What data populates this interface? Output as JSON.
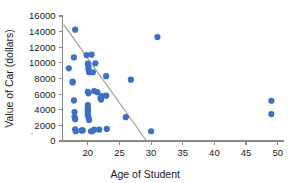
{
  "chart_data": {
    "type": "scatter",
    "title": "",
    "subtitle": "",
    "xlabel": "Age of Student",
    "ylabel": "Value of Car (dollars)",
    "xlim": [
      16,
      51
    ],
    "ylim": [
      0,
      16000
    ],
    "xticks": [
      20,
      25,
      30,
      35,
      40,
      45,
      50
    ],
    "xticklabels": [
      "20",
      "25",
      "30",
      "35",
      "40",
      "45",
      "50"
    ],
    "yticks": [
      0,
      2000,
      4000,
      6000,
      8000,
      10000,
      12000,
      14000,
      16000
    ],
    "yticklabels": [
      "0",
      "2000",
      "4000",
      "6000",
      "8000",
      "10000",
      "12000",
      "14000",
      "16000"
    ],
    "grid": false,
    "legend": null,
    "marker_color": "#3d6fc4",
    "marker_size": 3.1,
    "axis_color": "#8a8a8a",
    "trend_line": {
      "name": "least-squares regression line",
      "color": "#9a9a94",
      "x": [
        16.2,
        29.2
      ],
      "y": [
        14900,
        100
      ]
    },
    "series": [
      {
        "name": "Students",
        "points": [
          [
            18.0,
            14250
          ],
          [
            17.8,
            10700
          ],
          [
            17.0,
            9300
          ],
          [
            17.6,
            7600
          ],
          [
            17.6,
            7500
          ],
          [
            17.8,
            5200
          ],
          [
            17.9,
            3700
          ],
          [
            17.9,
            3100
          ],
          [
            18.0,
            2800
          ],
          [
            18.0,
            1500
          ],
          [
            18.1,
            1250
          ],
          [
            19.0,
            1350
          ],
          [
            19.2,
            1350
          ],
          [
            19.8,
            11000
          ],
          [
            20.6,
            11050
          ],
          [
            20.0,
            9900
          ],
          [
            20.1,
            9500
          ],
          [
            20.1,
            9200
          ],
          [
            20.2,
            8800
          ],
          [
            20.8,
            8800
          ],
          [
            21.2,
            9950
          ],
          [
            20.0,
            6300
          ],
          [
            20.1,
            6100
          ],
          [
            21.0,
            6400
          ],
          [
            21.5,
            6250
          ],
          [
            20.0,
            4600
          ],
          [
            20.0,
            4200
          ],
          [
            20.0,
            4000
          ],
          [
            20.0,
            3800
          ],
          [
            20.0,
            3500
          ],
          [
            20.0,
            3300
          ],
          [
            20.1,
            3000
          ],
          [
            20.2,
            2700
          ],
          [
            20.5,
            1250
          ],
          [
            20.7,
            1250
          ],
          [
            21.0,
            1450
          ],
          [
            21.8,
            1450
          ],
          [
            22.0,
            5500
          ],
          [
            22.1,
            5300
          ],
          [
            22.2,
            5750
          ],
          [
            22.9,
            5800
          ],
          [
            22.9,
            8300
          ],
          [
            23.0,
            1550
          ],
          [
            26.0,
            3050
          ],
          [
            26.8,
            7850
          ],
          [
            30.0,
            1250
          ],
          [
            31.0,
            13300
          ],
          [
            49.0,
            5150
          ],
          [
            49.0,
            3450
          ]
        ]
      }
    ]
  }
}
